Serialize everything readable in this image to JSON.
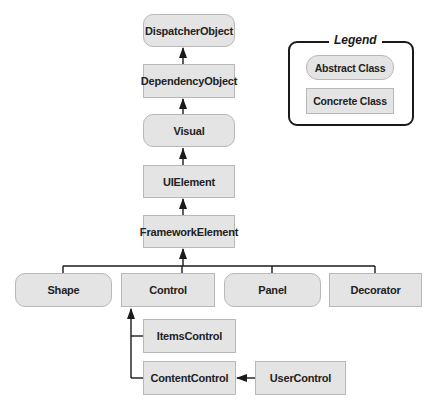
{
  "diagram": {
    "nodes": [
      {
        "id": "dispatcher_object",
        "label": "DispatcherObject",
        "kind": "abstract"
      },
      {
        "id": "dependency_object",
        "label": "DependencyObject",
        "kind": "concrete"
      },
      {
        "id": "visual",
        "label": "Visual",
        "kind": "abstract"
      },
      {
        "id": "ui_element",
        "label": "UIElement",
        "kind": "concrete"
      },
      {
        "id": "framework_element",
        "label": "FrameworkElement",
        "kind": "concrete"
      },
      {
        "id": "shape",
        "label": "Shape",
        "kind": "abstract"
      },
      {
        "id": "control",
        "label": "Control",
        "kind": "concrete"
      },
      {
        "id": "panel",
        "label": "Panel",
        "kind": "abstract"
      },
      {
        "id": "decorator",
        "label": "Decorator",
        "kind": "concrete"
      },
      {
        "id": "items_control",
        "label": "ItemsControl",
        "kind": "concrete"
      },
      {
        "id": "content_control",
        "label": "ContentControl",
        "kind": "concrete"
      },
      {
        "id": "user_control",
        "label": "UserControl",
        "kind": "concrete"
      }
    ],
    "edges": [
      {
        "from": "DependencyObject",
        "to": "DispatcherObject"
      },
      {
        "from": "Visual",
        "to": "DependencyObject"
      },
      {
        "from": "UIElement",
        "to": "Visual"
      },
      {
        "from": "FrameworkElement",
        "to": "UIElement"
      },
      {
        "from": "Shape",
        "to": "FrameworkElement"
      },
      {
        "from": "Control",
        "to": "FrameworkElement"
      },
      {
        "from": "Panel",
        "to": "FrameworkElement"
      },
      {
        "from": "Decorator",
        "to": "FrameworkElement"
      },
      {
        "from": "ItemsControl",
        "to": "Control"
      },
      {
        "from": "ContentControl",
        "to": "Control"
      },
      {
        "from": "UserControl",
        "to": "ContentControl"
      }
    ]
  },
  "legend": {
    "title": "Legend",
    "abstract_label": "Abstract Class",
    "concrete_label": "Concrete Class"
  },
  "colors": {
    "box_fill": "#e4e4e4",
    "box_border": "#b8b8b8",
    "line": "#1a1a1a"
  }
}
